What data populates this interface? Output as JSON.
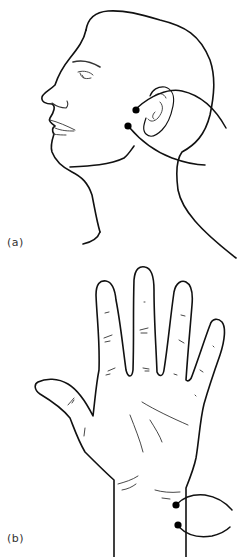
{
  "figure": {
    "panels": [
      {
        "id": "a",
        "label": "(a)",
        "subject": "head-profile",
        "electrodes": [
          {
            "position": "anterior to ear, upper",
            "x": 136,
            "y": 110
          },
          {
            "position": "anterior to ear, lower (jaw angle)",
            "x": 128,
            "y": 126
          }
        ]
      },
      {
        "id": "b",
        "label": "(b)",
        "subject": "palm-hand",
        "electrodes": [
          {
            "position": "ulnar wrist, upper",
            "x": 176,
            "y": 505
          },
          {
            "position": "ulnar wrist, lower",
            "x": 178,
            "y": 525
          }
        ]
      }
    ],
    "colors": {
      "line": "#111111",
      "electrode": "#000000",
      "label": "#333333",
      "background": "#ffffff"
    }
  }
}
